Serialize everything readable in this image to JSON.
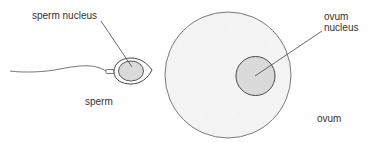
{
  "labels": {
    "sperm_nucleus": "sperm nucleus",
    "sperm": "sperm",
    "ovum_nucleus_line1": "ovum",
    "ovum_nucleus_line2": "nucleus",
    "ovum": "ovum"
  },
  "colors": {
    "stroke": "#555555",
    "nucleus_fill": "#dcdcdc",
    "cell_fill": "#f6f6f6"
  }
}
